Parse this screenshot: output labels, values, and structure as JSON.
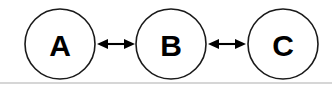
{
  "diagram": {
    "type": "node-link-diagram",
    "canvas": {
      "width": 332,
      "height": 86,
      "background": "#ffffff"
    },
    "style": {
      "node_fill": "#ffffff",
      "node_stroke": "#1a1a1a",
      "label_color": "#000000",
      "edge_color": "#000000",
      "rule_color": "#c9c9c9"
    },
    "nodes": [
      {
        "id": "A",
        "label": "A",
        "cx": 60,
        "cy": 44,
        "r": 35
      },
      {
        "id": "B",
        "label": "B",
        "cx": 171,
        "cy": 44,
        "r": 35
      },
      {
        "id": "C",
        "label": "C",
        "cx": 283,
        "cy": 44,
        "r": 35
      }
    ],
    "edges": [
      {
        "id": "A-B",
        "source": "A",
        "target": "B",
        "direction": "bidirectional",
        "x1": 97,
        "x2": 135,
        "y": 44
      },
      {
        "id": "B-C",
        "source": "B",
        "target": "C",
        "direction": "bidirectional",
        "x1": 208,
        "x2": 246,
        "y": 44
      }
    ],
    "rule": {
      "x1": 0,
      "x2": 332,
      "y": 83
    }
  }
}
